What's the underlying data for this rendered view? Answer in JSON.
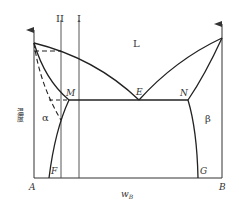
{
  "diagram": {
    "type": "binary-eutectic-phase-diagram",
    "y_axis_label": "温度",
    "x_axis_label_main": "w",
    "x_axis_label_sub": "B",
    "component_left": "A",
    "component_right": "B",
    "phase_liquid": "L",
    "phase_alpha": "α",
    "phase_beta": "β",
    "points": {
      "eutectic": "E",
      "alpha_max_solubility": "M",
      "beta_max_solubility": "N",
      "alpha_room_temp": "F",
      "beta_room_temp": "G"
    },
    "alloy_lines": [
      "II",
      "I"
    ],
    "colors": {
      "line": "#333333",
      "background": "#ffffff"
    }
  }
}
